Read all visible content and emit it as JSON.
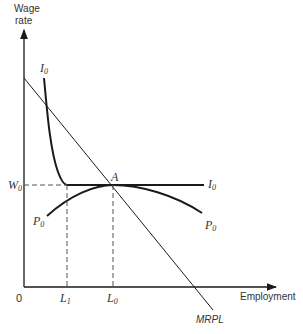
{
  "axes": {
    "y_label_line1": "Wage",
    "y_label_line2": "rate",
    "x_label": "Employment",
    "origin": "0"
  },
  "ticks": {
    "w0_main": "W",
    "w0_sub": "0",
    "l1_main": "L",
    "l1_sub": "1",
    "l0_main": "L",
    "l0_sub": "0"
  },
  "curves": {
    "i0_top_main": "I",
    "i0_top_sub": "0",
    "i0_right_main": "I",
    "i0_right_sub": "0",
    "p0_left_main": "P",
    "p0_left_sub": "0",
    "p0_right_main": "P",
    "p0_right_sub": "0",
    "mrpl": "MRPL",
    "point_a": "A"
  },
  "colors": {
    "line": "#1a1a1a",
    "dashed": "#555555",
    "background": "#ffffff"
  }
}
